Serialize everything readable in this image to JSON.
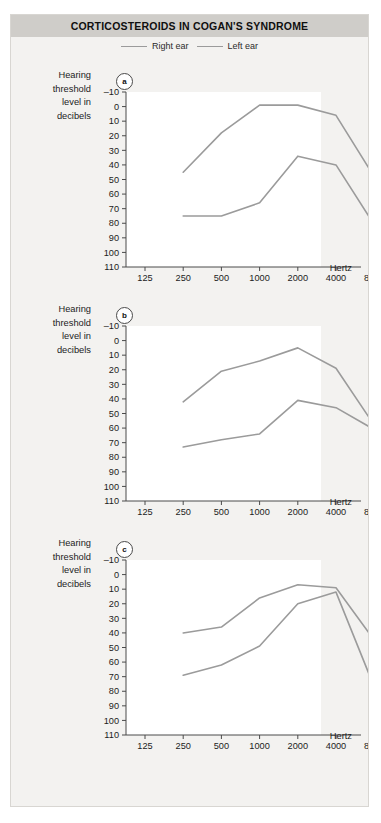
{
  "figure": {
    "title": "CORTICOSTEROIDS IN COGAN'S SYNDROME",
    "accent_header": "#cfcdc9",
    "line_color": "#9b9b9b",
    "axis_color": "#4a4a4a",
    "background": "#f3f2f0"
  },
  "legend": {
    "items": [
      {
        "label": "Right ear",
        "color": "#9b9b9b"
      },
      {
        "label": "Left ear",
        "color": "#9b9b9b"
      }
    ]
  },
  "axis": {
    "ylabel_lines": [
      "Hearing",
      "threshold",
      "level in",
      "decibels"
    ],
    "xlabel": "Hertz",
    "yticks": [
      -10,
      0,
      10,
      20,
      30,
      40,
      50,
      60,
      70,
      80,
      90,
      100,
      110
    ],
    "xticks": [
      125,
      250,
      500,
      1000,
      2000,
      4000,
      8000
    ]
  },
  "panels": [
    {
      "tag": "a"
    },
    {
      "tag": "b"
    },
    {
      "tag": "c"
    }
  ],
  "chart_data": [
    {
      "type": "line",
      "panel": "a",
      "title": "CORTICOSTEROIDS IN COGAN'S SYNDROME",
      "xlabel": "Hertz",
      "ylabel": "Hearing threshold level in decibels",
      "xscale": "log2-octave",
      "x": [
        250,
        500,
        1000,
        2000,
        4000,
        8000
      ],
      "xlim": [
        125,
        8000
      ],
      "ylim": [
        -10,
        110
      ],
      "y_inverted": true,
      "grid": false,
      "legend_position": "top-center",
      "series": [
        {
          "name": "Right ear",
          "values": [
            45,
            18,
            -1,
            -1,
            6,
            48
          ],
          "color": "#9b9b9b"
        },
        {
          "name": "Left ear",
          "values": [
            75,
            75,
            66,
            34,
            40,
            81
          ],
          "color": "#9b9b9b"
        }
      ]
    },
    {
      "type": "line",
      "panel": "b",
      "xlabel": "Hertz",
      "ylabel": "Hearing threshold level in decibels",
      "xscale": "log2-octave",
      "x": [
        250,
        500,
        1000,
        2000,
        4000,
        8000
      ],
      "xlim": [
        125,
        8000
      ],
      "ylim": [
        -10,
        110
      ],
      "y_inverted": true,
      "grid": false,
      "series": [
        {
          "name": "Right ear",
          "values": [
            42,
            21,
            14,
            5,
            19,
            58
          ],
          "color": "#9b9b9b"
        },
        {
          "name": "Left ear",
          "values": [
            73,
            68,
            64,
            41,
            46,
            61
          ],
          "color": "#9b9b9b"
        }
      ]
    },
    {
      "type": "line",
      "panel": "c",
      "xlabel": "Hertz",
      "ylabel": "Hearing threshold level in decibels",
      "xscale": "log2-octave",
      "x": [
        250,
        500,
        1000,
        2000,
        4000,
        8000
      ],
      "xlim": [
        125,
        8000
      ],
      "ylim": [
        -10,
        110
      ],
      "y_inverted": true,
      "grid": false,
      "series": [
        {
          "name": "Right ear",
          "values": [
            40,
            36,
            16,
            7,
            9,
            45
          ],
          "color": "#9b9b9b"
        },
        {
          "name": "Left ear",
          "values": [
            69,
            62,
            49,
            20,
            12,
            77
          ],
          "color": "#9b9b9b"
        }
      ]
    }
  ]
}
